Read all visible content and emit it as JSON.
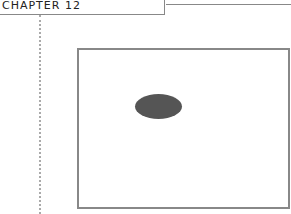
{
  "header": {
    "chapter_label": "CHAPTER 12"
  },
  "figure": {
    "shape": "ellipse",
    "fill_color": "#555555",
    "frame_color": "#888888"
  }
}
